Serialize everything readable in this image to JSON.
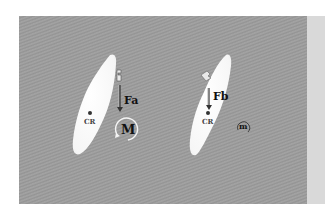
{
  "figure": {
    "background_color": "#9c9c9c",
    "side_strip_color": "#d9d9d9",
    "tooth_color": "#ffffff",
    "left": {
      "force_label": "Fa",
      "center_label": "CR",
      "moment_label": "M",
      "bracket": "bracket-icon"
    },
    "right": {
      "force_label": "Fb",
      "center_label": "CR",
      "moment_label": "m",
      "bracket": "bracket-icon"
    }
  }
}
